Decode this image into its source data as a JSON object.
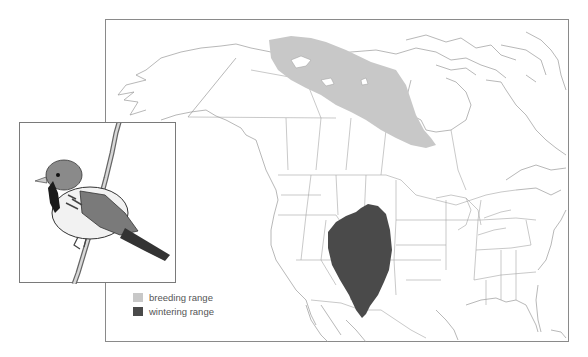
{
  "figure": {
    "regions_shown": [
      "Alaska",
      "Canada",
      "United States",
      "Mexico (north)",
      "Greenland (edge)"
    ]
  },
  "legend": {
    "items": [
      {
        "label": "breeding range",
        "color": "#c8c8c8"
      },
      {
        "label": "wintering range",
        "color": "#4a4a4a"
      }
    ]
  },
  "colors": {
    "border_lines": "#8a8a8a",
    "coastline": "#9a9a9a",
    "background": "#ffffff",
    "breeding_fill": "#c8c8c8",
    "wintering_fill": "#4a4a4a"
  },
  "inset": {
    "content": "bird-illustration",
    "description": "sparrow perched on branch"
  }
}
